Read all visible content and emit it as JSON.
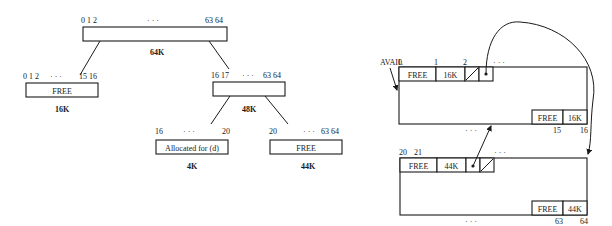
{
  "tree": {
    "root": {
      "label_left": "0 1 2",
      "label_dots": "· · ·",
      "label_right": "63 64",
      "size": "64K"
    },
    "left_child": {
      "label_left": "0 1 2",
      "label_dots": "· · ·",
      "label_right": "15 16",
      "content": "FREE",
      "size": "16K"
    },
    "right_child": {
      "label_left": "16 17",
      "label_dots": "· · ·",
      "label_right": "63 64",
      "size": "48K"
    },
    "right_left": {
      "label_left": "16",
      "label_dots": "· · ·",
      "label_right": "20",
      "content": "Allocated for (d)",
      "size": "4K"
    },
    "right_right": {
      "label_left": "20",
      "label_dots": "· · ·",
      "label_right": "63 64",
      "content": "FREE",
      "size": "44K"
    }
  },
  "list": {
    "avail_label": "AVAIL",
    "block1": {
      "idx0": "0",
      "idx1": "1",
      "idx2": "2",
      "dots_top": "· · ·",
      "tag": "FREE",
      "size": "16K",
      "tail_tag": "FREE",
      "tail_size": "16K",
      "end_left": "15",
      "end_right": "16",
      "dots_bottom": "· · ·"
    },
    "block2": {
      "idx0": "20",
      "idx1": "21",
      "dots_top": "· · ·",
      "tag": "FREE",
      "size": "44K",
      "tail_tag": "FREE",
      "tail_size": "44K",
      "end_left": "63",
      "end_right": "64",
      "dots_bottom": "· · ·"
    }
  }
}
